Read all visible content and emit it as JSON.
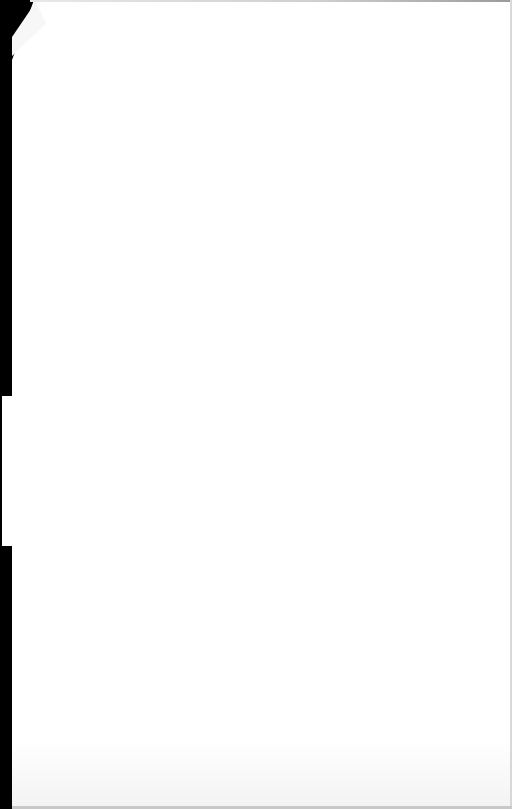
{
  "page": {
    "type": "blank-scanned-page",
    "text": "",
    "colors": {
      "paper": "#ffffff",
      "scan_edge": "#000000",
      "border": "#cfcfcf"
    }
  }
}
